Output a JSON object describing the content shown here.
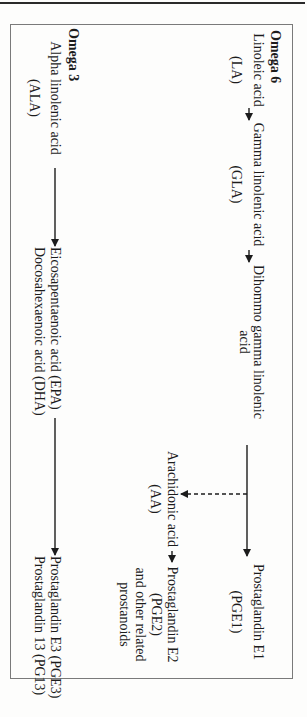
{
  "diagram": {
    "orientation": "rotated 90° clockwise",
    "omega6": {
      "heading": "Omega 6",
      "nodes": {
        "la": {
          "line1": "Linoleic acid",
          "line2": "(LA)"
        },
        "gla": {
          "line1": "Gamma linolenic acid",
          "line2": "(GLA)"
        },
        "dgla": {
          "line1": "Dihommo gamma linolenic",
          "line2": "acid"
        },
        "pge1": {
          "line1": "Prostaglandin E1",
          "line2": "(PGE1)"
        },
        "aa": {
          "line1": "Arachidonic acid",
          "line2": "(AA)"
        },
        "pge2": {
          "line1": "Prostaglandin E2",
          "line2": "(PGE2)",
          "line3": "and other related",
          "line4": "prostanoids"
        }
      }
    },
    "omega3": {
      "heading": "Omega 3",
      "nodes": {
        "ala": {
          "line1": "Alpha linolenic acid",
          "line2": "(ALA)"
        },
        "epa_dha": {
          "line1": "Eicosapentaenoic acid (EPA)",
          "line2": "Docosahexaenoic acid (DHA)"
        },
        "pge3": {
          "line1": "Prostaglandin E3 (PGE3)",
          "line2": "Prostaglandin 13 (PG13)"
        }
      }
    },
    "edges": [
      {
        "from": "LA",
        "to": "GLA",
        "style": "solid"
      },
      {
        "from": "GLA",
        "to": "DGLA",
        "style": "solid"
      },
      {
        "from": "DGLA",
        "to": "PGE1",
        "style": "solid"
      },
      {
        "from": "DGLA",
        "to": "AA",
        "style": "dashed"
      },
      {
        "from": "AA",
        "to": "PGE2",
        "style": "solid"
      },
      {
        "from": "ALA",
        "to": "EPA/DHA",
        "style": "solid"
      },
      {
        "from": "EPA/DHA",
        "to": "PGE3/PG13",
        "style": "solid"
      }
    ],
    "colors": {
      "ink": "#1c1c1c",
      "frame": "#7a7a7a",
      "background": "#fdfdfc"
    }
  }
}
